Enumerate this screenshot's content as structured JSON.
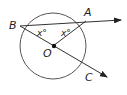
{
  "diagram": {
    "type": "circle-geometry",
    "circle": {
      "center_label": "O",
      "cx": 53,
      "cy": 46,
      "r": 33,
      "stroke": "#555555"
    },
    "points": {
      "B": {
        "label": "B",
        "x": 20,
        "y": 26
      },
      "A": {
        "label": "A",
        "x": 86,
        "y": 20
      },
      "O": {
        "label": "O",
        "x": 53,
        "y": 46
      },
      "C": {
        "label": "C",
        "x": 88,
        "y": 66
      }
    },
    "rays": [
      {
        "from": "B",
        "through": "A",
        "end": [
          122,
          19
        ]
      },
      {
        "from": "B",
        "through": "O",
        "end": [
          108,
          78
        ]
      }
    ],
    "segments": [
      {
        "from": "O",
        "to": "A"
      }
    ],
    "angle_labels": [
      {
        "text": "x°",
        "near": "B"
      },
      {
        "text": "x°",
        "near": "A"
      }
    ]
  }
}
